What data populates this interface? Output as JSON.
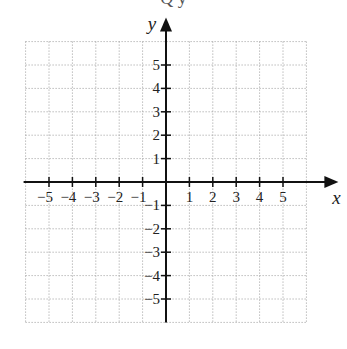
{
  "top_text_fragment": "Q       y",
  "chart_data": {
    "type": "coordinate-grid",
    "title": "",
    "xlabel": "x",
    "ylabel": "y",
    "xlim": [
      -6,
      6
    ],
    "ylim": [
      -6,
      6
    ],
    "grid": true,
    "grid_style": "dotted",
    "x_ticks": [
      -5,
      -4,
      -3,
      -2,
      -1,
      1,
      2,
      3,
      4,
      5
    ],
    "y_ticks": [
      -5,
      -4,
      -3,
      -2,
      -1,
      1,
      2,
      3,
      4,
      5
    ],
    "x_tick_labels": [
      "−5",
      "−4",
      "−3",
      "−2",
      "−1",
      "1",
      "2",
      "3",
      "4",
      "5"
    ],
    "y_tick_labels": [
      "−5",
      "−4",
      "−3",
      "−2",
      "−1",
      "1",
      "2",
      "3",
      "4",
      "5"
    ],
    "data_points": []
  },
  "colors": {
    "axis": "#111111",
    "grid": "#9a9a9a",
    "text": "#222222"
  }
}
